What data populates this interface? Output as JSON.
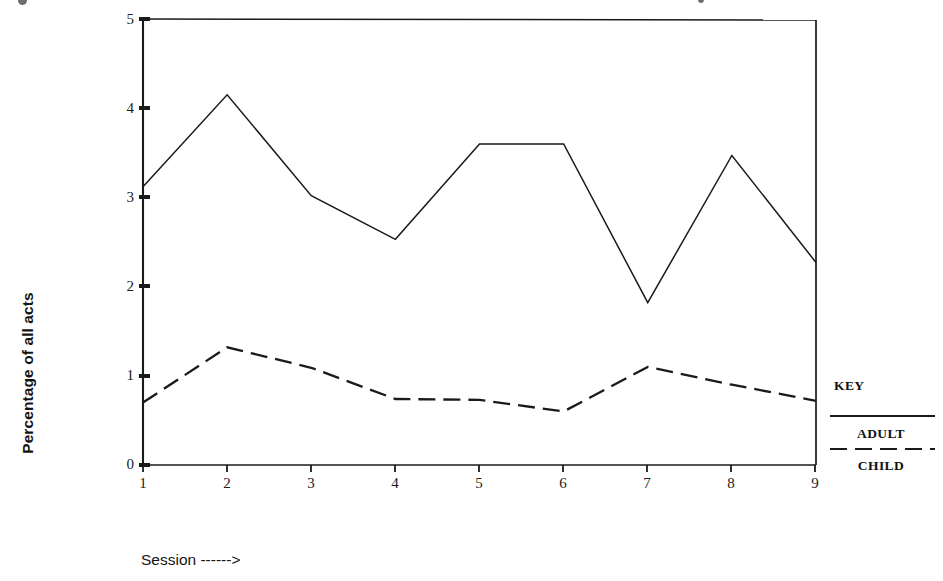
{
  "chart_data": {
    "type": "line",
    "title": "",
    "xlabel": "Session ------>",
    "ylabel": "Percentage of all acts",
    "x": [
      1,
      2,
      3,
      4,
      5,
      6,
      7,
      8,
      9
    ],
    "xtick_labels": [
      "1",
      "2",
      "3",
      "4",
      "5",
      "6",
      "7",
      "8",
      "9"
    ],
    "ytick_labels": [
      "0",
      "1",
      "2",
      "3",
      "4",
      "5"
    ],
    "xlim": [
      1,
      9
    ],
    "ylim": [
      0,
      5
    ],
    "grid": false,
    "legend_position": "right-outside",
    "series": [
      {
        "name": "ADULT",
        "style": "solid",
        "color": "#1a1a1a",
        "values": [
          3.12,
          4.15,
          3.02,
          2.53,
          3.6,
          3.6,
          1.82,
          3.47,
          2.27
        ]
      },
      {
        "name": "CHILD",
        "style": "dashed",
        "color": "#1a1a1a",
        "values": [
          0.7,
          1.32,
          1.09,
          0.74,
          0.73,
          0.6,
          1.1,
          0.9,
          0.72
        ]
      }
    ]
  },
  "axes": {
    "y_title": "Percentage of all acts",
    "x_title": "Session ------>",
    "y_ticks": [
      "5",
      "4",
      "3",
      "2",
      "1",
      "0"
    ],
    "x_ticks": [
      "1",
      "2",
      "3",
      "4",
      "5",
      "6",
      "7",
      "8",
      "9"
    ]
  },
  "legend": {
    "title": "KEY",
    "adult_label": "ADULT",
    "child_label": "CHILD"
  }
}
